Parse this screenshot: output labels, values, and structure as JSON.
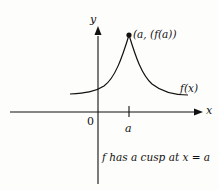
{
  "diagram": {
    "axes": {
      "x_label": "x",
      "y_label": "y",
      "origin_label": "0"
    },
    "point": {
      "label": "(a, (f(a))"
    },
    "curve": {
      "label": "f(x)"
    },
    "tick": {
      "label": "a"
    },
    "caption": "f has a cusp at x = a",
    "colors": {
      "ink": "#111111",
      "background": "#fdfdfc"
    }
  }
}
